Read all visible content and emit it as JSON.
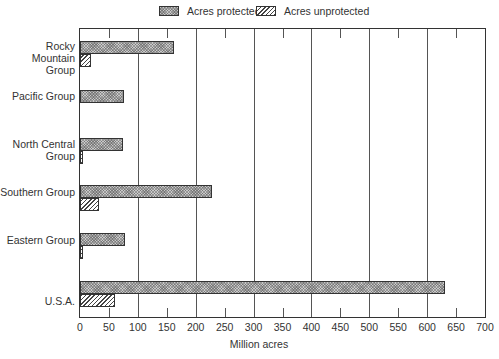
{
  "chart_data": {
    "type": "bar",
    "orientation": "horizontal",
    "title": "",
    "xlabel": "Million acres",
    "ylabel": "",
    "xlim": [
      0,
      700
    ],
    "xticks": [
      0,
      50,
      100,
      150,
      200,
      250,
      300,
      350,
      400,
      450,
      500,
      550,
      600,
      650,
      700
    ],
    "gridlines_at": [
      100,
      200,
      300,
      400,
      500,
      600
    ],
    "grid": true,
    "legend_position": "top",
    "categories": [
      "Rocky Mountain\nGroup",
      "Pacific Group",
      "North Central\nGroup",
      "Southern Group",
      "Eastern Group",
      "U.S.A."
    ],
    "series": [
      {
        "name": "Acres protected",
        "pattern": "cross-hatch gray",
        "values": [
          162,
          76,
          75,
          228,
          78,
          630
        ]
      },
      {
        "name": "Acres unprotected",
        "pattern": "diagonal hatch",
        "values": [
          19,
          0,
          4,
          33,
          2,
          60
        ]
      }
    ]
  },
  "legend": {
    "protected": "Acres protected",
    "unprotected": "Acres unprotected"
  },
  "axis": {
    "xlabel": "Million acres",
    "tick_labels": [
      "0",
      "50",
      "100",
      "150",
      "200",
      "250",
      "300",
      "350",
      "400",
      "450",
      "500",
      "550",
      "600",
      "650",
      "700"
    ]
  },
  "categories": {
    "rocky": "Rocky Mountain\nGroup",
    "pacific": "Pacific Group",
    "north_central": "North Central\nGroup",
    "southern": "Southern Group",
    "eastern": "Eastern Group",
    "usa": "U.S.A."
  },
  "colors": {
    "frame": "#333333",
    "protected_fill": "#c9c9c9",
    "unprotected_fill": "#ffffff"
  }
}
